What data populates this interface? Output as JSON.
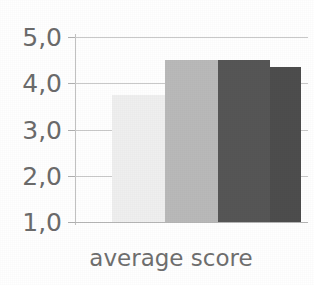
{
  "chart_data": {
    "type": "bar",
    "title": "",
    "subtitle": "",
    "xlabel": "average score",
    "ylabel": "",
    "categories": [
      "bar 1",
      "bar 2",
      "bar 3",
      "bar 4"
    ],
    "values": [
      3.75,
      4.5,
      4.5,
      4.35
    ],
    "series": [
      {
        "name": "average score",
        "values": [
          3.75,
          4.5,
          4.5,
          4.35
        ]
      }
    ],
    "bar_colors": [
      "#efefef",
      "#b9b9b9",
      "#565656",
      "#4d4d4d"
    ],
    "ylim": [
      1.0,
      5.0
    ],
    "ytick_values": [
      5.0,
      4.0,
      3.0,
      2.0,
      1.0
    ],
    "ytick_labels": [
      "5,0",
      "4,0",
      "3,0",
      "2,0",
      "1,0"
    ],
    "decimal_separator": ",",
    "grid": true,
    "grid_axis": "y",
    "grid_color": "#c9c9c9",
    "legend": false,
    "legend_position": "none",
    "axis_color": "#c2c2c2",
    "tick_label_color": "#6b6b6b",
    "caption_color": "#6f6f6f",
    "background": "#ffffff",
    "annotations": []
  },
  "axis": {
    "y_labels": {
      "t50": "5,0",
      "t40": "4,0",
      "t30": "3,0",
      "t20": "2,0",
      "t10": "1,0"
    },
    "x_caption": "average score"
  }
}
